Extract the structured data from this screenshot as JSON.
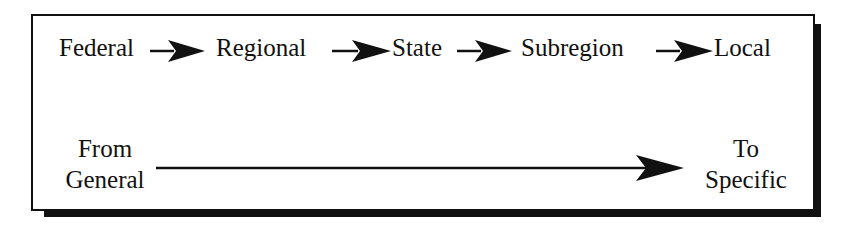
{
  "diagram": {
    "hierarchy": [
      {
        "label": "Federal"
      },
      {
        "label": "Regional"
      },
      {
        "label": "State"
      },
      {
        "label": "Subregion"
      },
      {
        "label": "Local"
      }
    ],
    "scale": {
      "start_line1": "From",
      "start_line2": "General",
      "end_line1": "To",
      "end_line2": "Specific"
    },
    "colors": {
      "ink": "#111111",
      "background": "#ffffff"
    }
  }
}
